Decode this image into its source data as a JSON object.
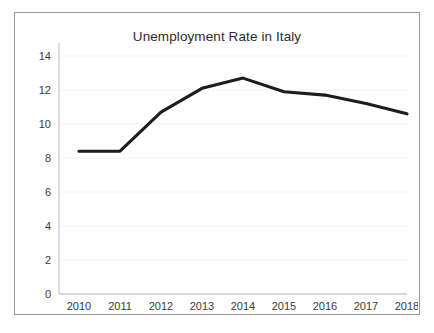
{
  "chart_data": {
    "type": "line",
    "title": "Unemployment Rate in Italy",
    "xlabel": "",
    "ylabel": "",
    "categories": [
      "2010",
      "2011",
      "2012",
      "2013",
      "2014",
      "2015",
      "2016",
      "2017",
      "2018"
    ],
    "values": [
      8.4,
      8.4,
      10.7,
      12.1,
      12.7,
      11.9,
      11.7,
      11.2,
      10.6
    ],
    "series": [
      {
        "name": "Unemployment Rate",
        "values": [
          8.4,
          8.4,
          10.7,
          12.1,
          12.7,
          11.9,
          11.7,
          11.2,
          10.6
        ]
      }
    ],
    "y_ticks": [
      "0",
      "2",
      "4",
      "6",
      "8",
      "10",
      "12",
      "14"
    ],
    "y_tick_values": [
      0,
      2,
      4,
      6,
      8,
      10,
      12,
      14
    ],
    "ylim": [
      0,
      14.7
    ],
    "xlim": [
      "2010",
      "2018"
    ],
    "grid": true,
    "legend": false,
    "legend_position": "none",
    "colors": {
      "line": "#1d1d1d",
      "grid": "#f2f2f2",
      "axis": "#b9b9b9",
      "frame_border": "#9a9a9a",
      "background": "#ffffff",
      "tick_text": "#3a3a3a",
      "title_text": "#2c2c2c"
    }
  }
}
